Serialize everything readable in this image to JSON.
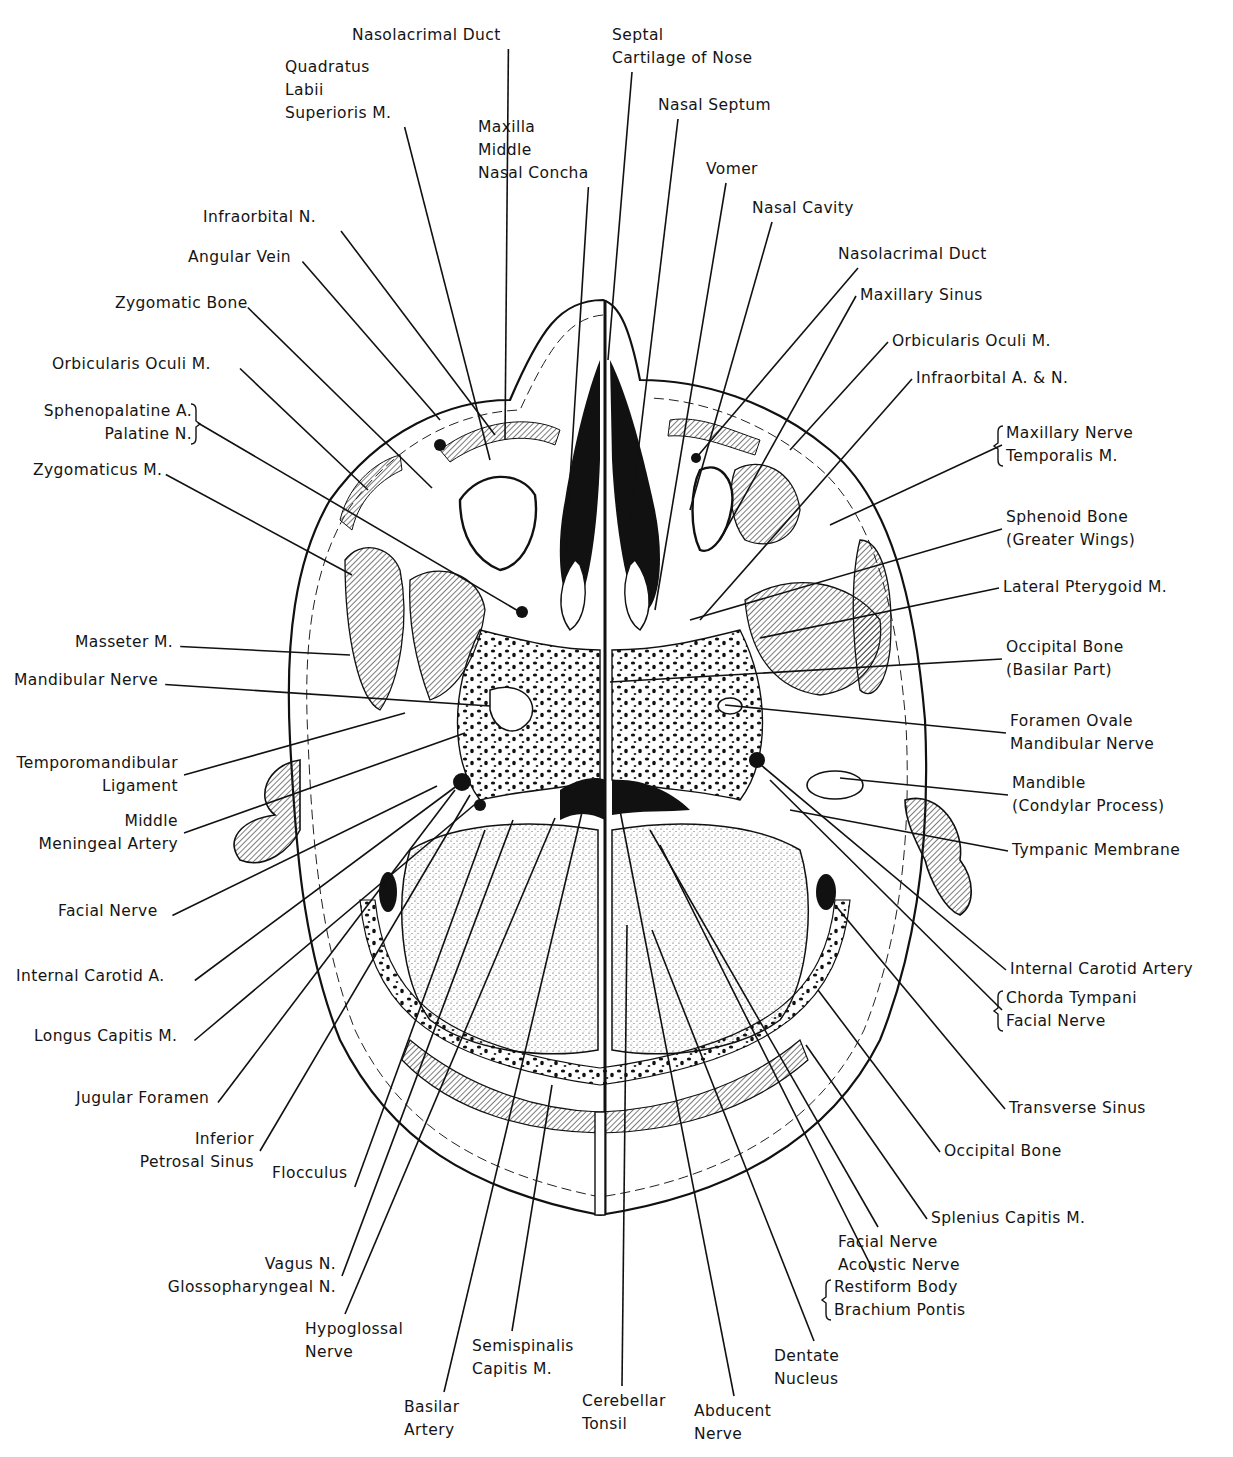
{
  "figure": {
    "background": "#ffffff",
    "ink": "#111111"
  },
  "labels": [
    {
      "id": "nasolacrimal-duct-left",
      "lines": [
        "Nasolacrimal Duct"
      ],
      "x": 352,
      "y": 24,
      "align": "left",
      "target": [
        505,
        440
      ]
    },
    {
      "id": "quadratus-labii-superioris",
      "lines": [
        "Quadratus",
        "Labii",
        "Superioris M."
      ],
      "x": 285,
      "y": 56,
      "align": "left",
      "target": [
        490,
        460
      ]
    },
    {
      "id": "maxilla-middle-nasal-concha",
      "lines": [
        "Maxilla",
        "Middle",
        "Nasal Concha"
      ],
      "x": 478,
      "y": 116,
      "align": "left",
      "target": [
        565,
        560
      ]
    },
    {
      "id": "septal-cartilage",
      "lines": [
        "Septal",
        "Cartilage of Nose"
      ],
      "x": 612,
      "y": 24,
      "align": "left",
      "target": [
        608,
        360
      ]
    },
    {
      "id": "nasal-septum",
      "lines": [
        "Nasal Septum"
      ],
      "x": 658,
      "y": 94,
      "align": "left",
      "target": [
        630,
        520
      ]
    },
    {
      "id": "vomer",
      "lines": [
        "Vomer"
      ],
      "x": 706,
      "y": 158,
      "align": "left",
      "target": [
        655,
        610
      ]
    },
    {
      "id": "nasal-cavity",
      "lines": [
        "Nasal Cavity"
      ],
      "x": 752,
      "y": 197,
      "align": "left",
      "target": [
        690,
        510
      ]
    },
    {
      "id": "nasolacrimal-duct-right",
      "lines": [
        "Nasolacrimal Duct"
      ],
      "x": 838,
      "y": 243,
      "align": "left",
      "target": [
        696,
        458
      ]
    },
    {
      "id": "maxillary-sinus",
      "lines": [
        "Maxillary Sinus"
      ],
      "x": 860,
      "y": 284,
      "align": "left",
      "target": [
        720,
        540
      ]
    },
    {
      "id": "orbicularis-oculi-right",
      "lines": [
        "Orbicularis Oculi M."
      ],
      "x": 892,
      "y": 330,
      "align": "left",
      "target": [
        790,
        450
      ]
    },
    {
      "id": "infraorbital-a-n",
      "lines": [
        "Infraorbital A. & N."
      ],
      "x": 916,
      "y": 367,
      "align": "left",
      "target": [
        700,
        620
      ]
    },
    {
      "id": "maxillary-nerve-temporalis",
      "lines": [
        "Maxillary Nerve",
        "Temporalis M."
      ],
      "x": 1006,
      "y": 422,
      "align": "left",
      "bracket": "left",
      "target": [
        830,
        525
      ]
    },
    {
      "id": "sphenoid-bone",
      "lines": [
        "Sphenoid Bone",
        "(Greater Wings)"
      ],
      "x": 1006,
      "y": 506,
      "align": "left",
      "target": [
        690,
        620
      ]
    },
    {
      "id": "lateral-pterygoid",
      "lines": [
        "Lateral Pterygoid M."
      ],
      "x": 1003,
      "y": 576,
      "align": "left",
      "target": [
        760,
        638
      ]
    },
    {
      "id": "occipital-bone-basilar",
      "lines": [
        "Occipital Bone",
        "(Basilar Part)"
      ],
      "x": 1006,
      "y": 636,
      "align": "left",
      "target": [
        610,
        682
      ]
    },
    {
      "id": "foramen-ovale",
      "lines": [
        "Foramen Ovale",
        "Mandibular Nerve"
      ],
      "x": 1010,
      "y": 710,
      "align": "left",
      "target": [
        725,
        705
      ]
    },
    {
      "id": "mandible-condylar",
      "lines": [
        "Mandible",
        "(Condylar Process)"
      ],
      "x": 1012,
      "y": 772,
      "align": "left",
      "target": [
        840,
        778
      ]
    },
    {
      "id": "tympanic-membrane",
      "lines": [
        "Tympanic Membrane"
      ],
      "x": 1012,
      "y": 839,
      "align": "left",
      "target": [
        790,
        810
      ]
    },
    {
      "id": "internal-carotid-artery-right",
      "lines": [
        "Internal Carotid Artery"
      ],
      "x": 1010,
      "y": 958,
      "align": "left",
      "target": [
        755,
        760
      ]
    },
    {
      "id": "chorda-tympani-facial",
      "lines": [
        "Chorda Tympani",
        "Facial Nerve"
      ],
      "x": 1006,
      "y": 987,
      "align": "left",
      "bracket": "left",
      "target": [
        770,
        780
      ]
    },
    {
      "id": "transverse-sinus",
      "lines": [
        "Transverse Sinus"
      ],
      "x": 1009,
      "y": 1097,
      "align": "left",
      "target": [
        835,
        905
      ]
    },
    {
      "id": "occipital-bone",
      "lines": [
        "Occipital Bone"
      ],
      "x": 944,
      "y": 1140,
      "align": "left",
      "target": [
        818,
        990
      ]
    },
    {
      "id": "splenius-capitis",
      "lines": [
        "Splenius Capitis M."
      ],
      "x": 931,
      "y": 1207,
      "align": "left",
      "target": [
        806,
        1045
      ]
    },
    {
      "id": "facial-acoustic-nerve",
      "lines": [
        "Facial Nerve",
        "Acoustic Nerve"
      ],
      "x": 838,
      "y": 1231,
      "align": "left",
      "target": [
        650,
        830
      ]
    },
    {
      "id": "restiform-brachium",
      "lines": [
        "Restiform Body",
        "Brachium Pontis"
      ],
      "x": 834,
      "y": 1276,
      "align": "left",
      "bracket": "left",
      "target": [
        660,
        845
      ]
    },
    {
      "id": "dentate-nucleus",
      "lines": [
        "Dentate",
        "Nucleus"
      ],
      "x": 774,
      "y": 1345,
      "align": "left",
      "target": [
        652,
        930
      ]
    },
    {
      "id": "abducent-nerve",
      "lines": [
        "Abducent",
        "Nerve"
      ],
      "x": 694,
      "y": 1400,
      "align": "left",
      "target": [
        616,
        790
      ]
    },
    {
      "id": "cerebellar-tonsil",
      "lines": [
        "Cerebellar",
        "Tonsil"
      ],
      "x": 582,
      "y": 1390,
      "align": "left",
      "target": [
        627,
        925
      ]
    },
    {
      "id": "semispinalis-capitis",
      "lines": [
        "Semispinalis",
        "Capitis M."
      ],
      "x": 472,
      "y": 1335,
      "align": "left",
      "target": [
        552,
        1085
      ]
    },
    {
      "id": "basilar-artery",
      "lines": [
        "Basilar",
        "Artery"
      ],
      "x": 404,
      "y": 1396,
      "align": "left",
      "target": [
        583,
        808
      ]
    },
    {
      "id": "hypoglossal-nerve",
      "lines": [
        "Hypoglossal",
        "Nerve"
      ],
      "x": 305,
      "y": 1318,
      "align": "left",
      "target": [
        555,
        818
      ]
    },
    {
      "id": "vagus-glossopharyngeal",
      "lines": [
        "Vagus N.",
        "Glossopharyngeal N."
      ],
      "x": 150,
      "y": 1253,
      "align": "right",
      "right": 336,
      "target": [
        513,
        820
      ]
    },
    {
      "id": "flocculus",
      "lines": [
        "Flocculus"
      ],
      "x": 272,
      "y": 1162,
      "align": "left",
      "target": [
        485,
        830
      ]
    },
    {
      "id": "inferior-petrosal-sinus",
      "lines": [
        "Inferior",
        "Petrosal Sinus"
      ],
      "x": 128,
      "y": 1128,
      "align": "right",
      "right": 254,
      "target": [
        470,
        795
      ]
    },
    {
      "id": "jugular-foramen",
      "lines": [
        "Jugular Foramen"
      ],
      "x": 76,
      "y": 1087,
      "align": "left",
      "target": [
        455,
        790
      ]
    },
    {
      "id": "longus-capitis",
      "lines": [
        "Longus Capitis M."
      ],
      "x": 34,
      "y": 1025,
      "align": "left",
      "target": [
        480,
        800
      ]
    },
    {
      "id": "internal-carotid-a-left",
      "lines": [
        "Internal Carotid A."
      ],
      "x": 16,
      "y": 965,
      "align": "left",
      "target": [
        462,
        782
      ]
    },
    {
      "id": "facial-nerve-left",
      "lines": [
        "Facial Nerve"
      ],
      "x": 58,
      "y": 900,
      "align": "left",
      "target": [
        437,
        786
      ]
    },
    {
      "id": "middle-meningeal-artery",
      "lines": [
        "Middle",
        "Meningeal Artery"
      ],
      "x": 20,
      "y": 810,
      "align": "right",
      "right": 178,
      "target": [
        465,
        733
      ]
    },
    {
      "id": "temporomandibular-ligament",
      "lines": [
        "Temporomandibular",
        "Ligament"
      ],
      "x": 14,
      "y": 752,
      "align": "right",
      "right": 178,
      "target": [
        405,
        713
      ]
    },
    {
      "id": "mandibular-nerve-left",
      "lines": [
        "Mandibular Nerve"
      ],
      "x": 14,
      "y": 669,
      "align": "left",
      "target": [
        490,
        706
      ]
    },
    {
      "id": "masseter",
      "lines": [
        "Masseter M."
      ],
      "x": 75,
      "y": 631,
      "align": "left",
      "target": [
        350,
        655
      ]
    },
    {
      "id": "zygomaticus",
      "lines": [
        "Zygomaticus M."
      ],
      "x": 33,
      "y": 459,
      "align": "left",
      "target": [
        352,
        575
      ]
    },
    {
      "id": "sphenopalatine-palatine",
      "lines": [
        "Sphenopalatine A.",
        "Palatine N."
      ],
      "x": 16,
      "y": 400,
      "align": "right",
      "right": 192,
      "bracket": "right",
      "target": [
        520,
        612
      ]
    },
    {
      "id": "orbicularis-oculi-left",
      "lines": [
        "Orbicularis Oculi M."
      ],
      "x": 52,
      "y": 353,
      "align": "left",
      "target": [
        368,
        490
      ]
    },
    {
      "id": "zygomatic-bone",
      "lines": [
        "Zygomatic Bone"
      ],
      "x": 115,
      "y": 292,
      "align": "left",
      "target": [
        432,
        488
      ]
    },
    {
      "id": "angular-vein",
      "lines": [
        "Angular Vein"
      ],
      "x": 188,
      "y": 246,
      "align": "left",
      "target": [
        440,
        420
      ]
    },
    {
      "id": "infraorbital-n",
      "lines": [
        "Infraorbital N."
      ],
      "x": 203,
      "y": 206,
      "align": "left",
      "target": [
        495,
        435
      ]
    }
  ]
}
